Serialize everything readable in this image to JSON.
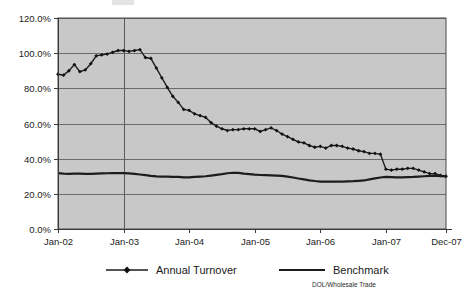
{
  "chart_data": {
    "type": "line",
    "title": "",
    "subtitle": "",
    "xlabel": "",
    "ylabel": "",
    "ylim": [
      0,
      120
    ],
    "grid": true,
    "legend_position": "bottom",
    "source_note": "DOL/Wholesale Trade",
    "y_ticks": [
      "0.0%",
      "20.0%",
      "40.0%",
      "60.0%",
      "80.0%",
      "100.0%",
      "120.0%"
    ],
    "y_tick_values": [
      0,
      20,
      40,
      60,
      80,
      100,
      120
    ],
    "x_ticks": [
      "Jan-02",
      "Jan-03",
      "Jan-04",
      "Jan-05",
      "Jan-06",
      "Jan-07",
      "Dec-07"
    ],
    "x_tick_indices": [
      0,
      12,
      24,
      36,
      48,
      60,
      71
    ],
    "x": [
      "Jan-02",
      "Feb-02",
      "Mar-02",
      "Apr-02",
      "May-02",
      "Jun-02",
      "Jul-02",
      "Aug-02",
      "Sep-02",
      "Oct-02",
      "Nov-02",
      "Dec-02",
      "Jan-03",
      "Feb-03",
      "Mar-03",
      "Apr-03",
      "May-03",
      "Jun-03",
      "Jul-03",
      "Aug-03",
      "Sep-03",
      "Oct-03",
      "Nov-03",
      "Dec-03",
      "Jan-04",
      "Feb-04",
      "Mar-04",
      "Apr-04",
      "May-04",
      "Jun-04",
      "Jul-04",
      "Aug-04",
      "Sep-04",
      "Oct-04",
      "Nov-04",
      "Dec-04",
      "Jan-05",
      "Feb-05",
      "Mar-05",
      "Apr-05",
      "May-05",
      "Jun-05",
      "Jul-05",
      "Aug-05",
      "Sep-05",
      "Oct-05",
      "Nov-05",
      "Dec-05",
      "Jan-06",
      "Feb-06",
      "Mar-06",
      "Apr-06",
      "May-06",
      "Jun-06",
      "Jul-06",
      "Aug-06",
      "Sep-06",
      "Oct-06",
      "Nov-06",
      "Dec-06",
      "Jan-07",
      "Feb-07",
      "Mar-07",
      "Apr-07",
      "May-07",
      "Jun-07",
      "Jul-07",
      "Aug-07",
      "Sep-07",
      "Oct-07",
      "Nov-07",
      "Dec-07"
    ],
    "series": [
      {
        "name": "Annual Turnover",
        "marker": "diamond",
        "line_width": "thin",
        "color": "#1c1c1c",
        "values": [
          88.0,
          87.5,
          90.0,
          93.5,
          89.5,
          90.5,
          94.0,
          98.5,
          99.0,
          99.5,
          100.5,
          101.5,
          101.5,
          101.0,
          101.5,
          102.0,
          97.5,
          97.0,
          91.5,
          86.0,
          80.5,
          75.5,
          72.0,
          68.0,
          67.5,
          65.5,
          64.5,
          63.5,
          60.5,
          58.5,
          57.0,
          56.0,
          56.5,
          56.5,
          57.0,
          57.0,
          57.0,
          55.5,
          56.5,
          57.5,
          56.0,
          54.0,
          52.5,
          51.0,
          49.5,
          49.0,
          47.5,
          46.5,
          47.0,
          46.0,
          47.5,
          47.5,
          47.0,
          46.0,
          45.5,
          44.5,
          44.0,
          43.0,
          43.0,
          42.5,
          34.0,
          33.5,
          34.0,
          34.0,
          34.5,
          34.5,
          33.5,
          32.5,
          31.5,
          31.5,
          30.5,
          30.0
        ]
      },
      {
        "name": "Benchmark",
        "marker": "none",
        "line_width": "thick",
        "color": "#1c1c1c",
        "values": [
          31.8,
          31.5,
          31.4,
          31.5,
          31.5,
          31.4,
          31.4,
          31.5,
          31.6,
          31.7,
          31.8,
          31.8,
          31.8,
          31.6,
          31.3,
          31.0,
          30.6,
          30.2,
          29.9,
          29.8,
          29.8,
          29.7,
          29.6,
          29.4,
          29.4,
          29.6,
          29.8,
          30.0,
          30.4,
          30.8,
          31.2,
          31.7,
          32.0,
          31.9,
          31.5,
          31.2,
          30.9,
          30.7,
          30.6,
          30.5,
          30.4,
          30.2,
          29.8,
          29.3,
          28.7,
          28.2,
          27.7,
          27.3,
          27.0,
          26.9,
          26.9,
          27.0,
          27.0,
          27.1,
          27.2,
          27.4,
          27.6,
          28.2,
          28.8,
          29.3,
          29.6,
          29.5,
          29.4,
          29.4,
          29.5,
          29.6,
          29.8,
          30.0,
          30.2,
          30.3,
          30.1,
          29.9
        ]
      }
    ]
  },
  "legend": {
    "items": [
      {
        "label": "Annual Turnover"
      },
      {
        "label": "Benchmark"
      }
    ]
  }
}
